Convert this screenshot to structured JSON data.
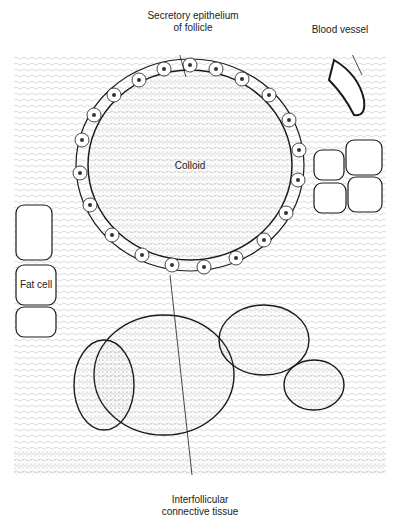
{
  "figure": {
    "type": "histology-illustration",
    "labels": {
      "secretory_epithelium": [
        "Secretory epithelium",
        "of follicle"
      ],
      "blood_vessel": "Blood vessel",
      "colloid": "Colloid",
      "fat_cell": "Fat cell",
      "interfollicular": [
        "Interfollicular",
        "connective tissue"
      ]
    },
    "colors": {
      "ink": "#1a1a1a",
      "paper": "#ffffff",
      "stipple": "#d8d8d8"
    }
  }
}
